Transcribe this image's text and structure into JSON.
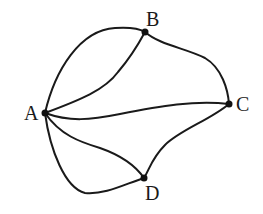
{
  "diagram": {
    "type": "multigraph",
    "nodes": [
      {
        "id": "A",
        "label": "A",
        "x": 45,
        "y": 113
      },
      {
        "id": "B",
        "label": "B",
        "x": 145,
        "y": 32
      },
      {
        "id": "C",
        "label": "C",
        "x": 229,
        "y": 104
      },
      {
        "id": "D",
        "label": "D",
        "x": 144,
        "y": 178
      }
    ],
    "edges": [
      {
        "from": "A",
        "to": "B",
        "variant": "outer"
      },
      {
        "from": "A",
        "to": "B",
        "variant": "inner"
      },
      {
        "from": "B",
        "to": "C"
      },
      {
        "from": "A",
        "to": "C"
      },
      {
        "from": "C",
        "to": "D"
      },
      {
        "from": "A",
        "to": "D",
        "variant": "upper"
      },
      {
        "from": "A",
        "to": "D",
        "variant": "lower"
      }
    ],
    "labels": {
      "A": "A",
      "B": "B",
      "C": "C",
      "D": "D"
    },
    "colors": {
      "stroke": "#1a1a1a",
      "node": "#111111",
      "background": "#ffffff"
    }
  }
}
